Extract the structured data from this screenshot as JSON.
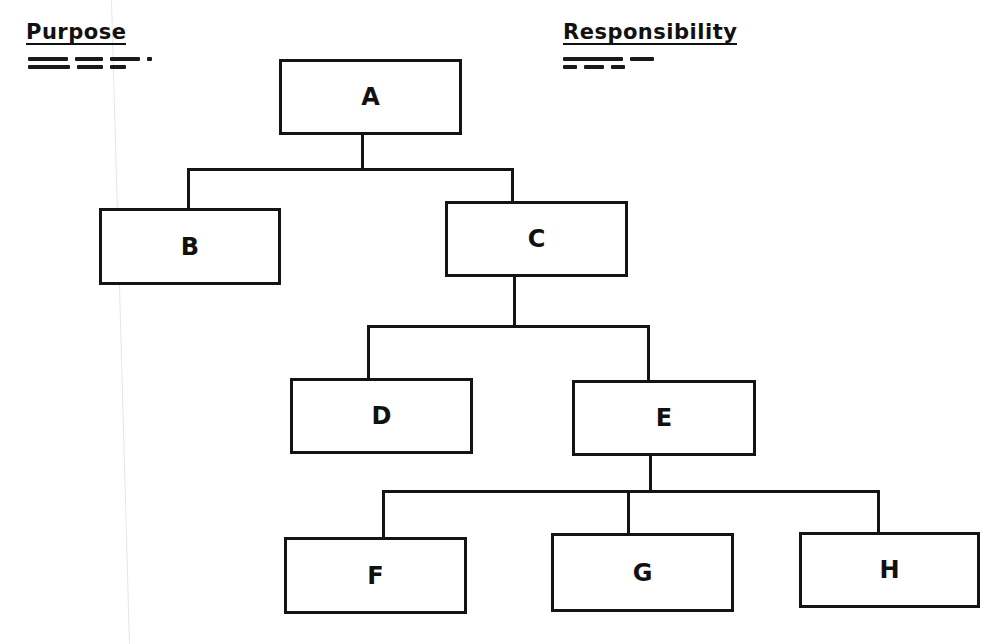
{
  "headers": {
    "purpose": "Purpose",
    "responsibility": "Responsibility"
  },
  "illegible_notes": {
    "purpose_lines": 2,
    "responsibility_lines": 2
  },
  "chart": {
    "type": "org-chart",
    "nodes": [
      {
        "id": "A",
        "label": "A",
        "parent": null
      },
      {
        "id": "B",
        "label": "B",
        "parent": "A"
      },
      {
        "id": "C",
        "label": "C",
        "parent": "A"
      },
      {
        "id": "D",
        "label": "D",
        "parent": "C"
      },
      {
        "id": "E",
        "label": "E",
        "parent": "C"
      },
      {
        "id": "F",
        "label": "F",
        "parent": "E"
      },
      {
        "id": "G",
        "label": "G",
        "parent": "E"
      },
      {
        "id": "H",
        "label": "H",
        "parent": "E"
      }
    ]
  },
  "colors": {
    "ink": "#141414",
    "background": "#ffffff"
  }
}
